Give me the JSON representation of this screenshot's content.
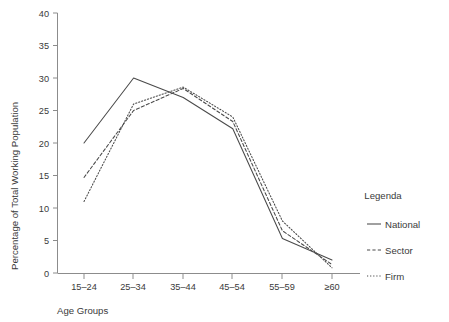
{
  "chart_data": {
    "type": "line",
    "title": "",
    "xlabel": "Age Groups",
    "ylabel": "Percentage of Total Working Population",
    "categories": [
      "15–24",
      "25–34",
      "35–44",
      "45–54",
      "55–59",
      "≥60"
    ],
    "ylim": [
      0,
      40
    ],
    "yticks": [
      0,
      5,
      10,
      15,
      20,
      25,
      30,
      35,
      40
    ],
    "ytick_labels": [
      "0",
      "5",
      "10",
      "15",
      "20",
      "25",
      "30",
      "35",
      "40"
    ],
    "grid": false,
    "legend_position": "right",
    "legend_title": "Legenda",
    "series": [
      {
        "name": "National",
        "style": "solid",
        "values": [
          20.0,
          30.0,
          27.0,
          22.2,
          5.3,
          2.0
        ]
      },
      {
        "name": "Sector",
        "style": "dashed",
        "values": [
          14.7,
          25.0,
          28.4,
          23.3,
          6.5,
          1.3
        ]
      },
      {
        "name": "Firm",
        "style": "dotted",
        "values": [
          11.0,
          26.0,
          28.6,
          24.0,
          8.0,
          0.8
        ]
      }
    ],
    "colors": {
      "axis": "#8c8c8c",
      "line": "#4a4a4a",
      "text": "#3a3a3a",
      "background": "#ffffff"
    }
  }
}
